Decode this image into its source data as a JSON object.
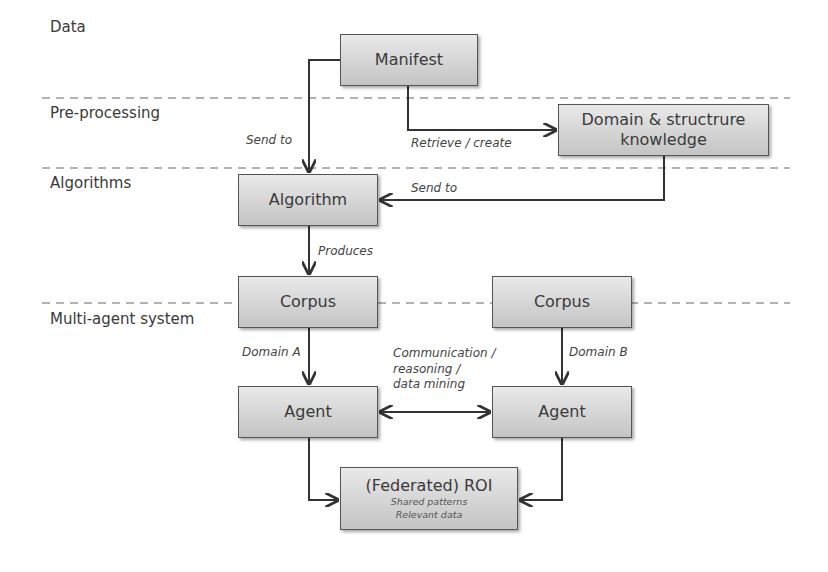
{
  "lanes": [
    {
      "label": "Data"
    },
    {
      "label": "Pre-processing"
    },
    {
      "label": "Algorithms"
    },
    {
      "label": "Multi-agent system"
    }
  ],
  "nodes": {
    "manifest": {
      "label": "Manifest"
    },
    "domain_knowledge": {
      "line1": "Domain & structrure",
      "line2": "knowledge"
    },
    "algorithm": {
      "label": "Algorithm"
    },
    "corpus_a": {
      "label": "Corpus"
    },
    "corpus_b": {
      "label": "Corpus"
    },
    "agent_a": {
      "label": "Agent"
    },
    "agent_b": {
      "label": "Agent"
    },
    "roi": {
      "label": "(Federated) ROI",
      "sub1": "Shared patterns",
      "sub2": "Relevant data"
    }
  },
  "edges": {
    "manifest_to_algorithm": "Send to",
    "manifest_to_domain": "Retrieve / create",
    "domain_to_algorithm": "Send to",
    "algorithm_to_corpus": "Produces",
    "corpus_a_to_agent_a": "Domain A",
    "corpus_b_to_agent_b": "Domain B",
    "agent_to_agent": {
      "line1": "Communication /",
      "line2": "reasoning /",
      "line3": "data mining"
    }
  },
  "colors": {
    "box_top": "#e9e9e9",
    "box_bottom": "#c4c4c4",
    "border": "#555555",
    "arrow": "#333333",
    "dashed": "#9a9a9a"
  }
}
